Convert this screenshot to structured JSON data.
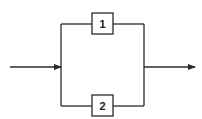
{
  "diagram": {
    "type": "parallel-system-block-diagram",
    "colors": {
      "stroke": "#2a2a2a",
      "background": "#ffffff",
      "text": "#222222"
    },
    "blocks": [
      {
        "id": "block-1",
        "label": "1",
        "branch": "top"
      },
      {
        "id": "block-2",
        "label": "2",
        "branch": "bottom"
      }
    ],
    "arrows": [
      {
        "id": "input-arrow",
        "direction": "right"
      },
      {
        "id": "output-arrow",
        "direction": "right"
      }
    ]
  }
}
